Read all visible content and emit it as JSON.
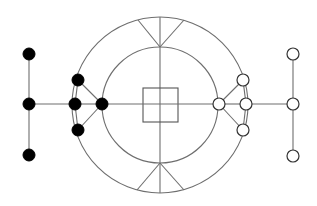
{
  "diagram": {
    "width": 317,
    "height": 206,
    "colors": {
      "line": "#6e6e6e",
      "filled_node": "#000000",
      "open_node_fill": "#ffffff",
      "open_node_stroke": "#333333",
      "background": "#ffffff"
    },
    "center": {
      "x": 160,
      "y": 105
    },
    "rings": [
      {
        "name": "outer-ring",
        "r": 88
      },
      {
        "name": "inner-ring",
        "r": 58
      }
    ],
    "center_square": {
      "x": 143,
      "y": 88,
      "w": 35,
      "h": 34
    },
    "spokes": [
      {
        "name": "vertical-axis",
        "x1": 160,
        "y1": 17,
        "x2": 160,
        "y2": 193
      },
      {
        "name": "top-spoke-left",
        "x1": 160,
        "y1": 47,
        "x2": 138,
        "y2": 20
      },
      {
        "name": "top-spoke-right",
        "x1": 160,
        "y1": 47,
        "x2": 184,
        "y2": 20
      },
      {
        "name": "bottom-spoke-left",
        "x1": 160,
        "y1": 163,
        "x2": 137,
        "y2": 190
      },
      {
        "name": "bottom-spoke-right",
        "x1": 160,
        "y1": 163,
        "x2": 184,
        "y2": 190
      }
    ],
    "nodes": [
      {
        "id": "L1",
        "x": 29,
        "y": 54,
        "type": "filled"
      },
      {
        "id": "L2",
        "x": 29,
        "y": 104,
        "type": "filled"
      },
      {
        "id": "L3",
        "x": 29,
        "y": 155,
        "type": "filled"
      },
      {
        "id": "B1",
        "x": 78,
        "y": 80,
        "type": "filled"
      },
      {
        "id": "B2",
        "x": 75,
        "y": 104,
        "type": "filled"
      },
      {
        "id": "B3",
        "x": 78,
        "y": 130,
        "type": "filled"
      },
      {
        "id": "B4",
        "x": 102,
        "y": 104,
        "type": "filled"
      },
      {
        "id": "W4",
        "x": 219,
        "y": 104,
        "type": "open"
      },
      {
        "id": "W1",
        "x": 243,
        "y": 80,
        "type": "open"
      },
      {
        "id": "W2",
        "x": 246,
        "y": 104,
        "type": "open"
      },
      {
        "id": "W3",
        "x": 243,
        "y": 130,
        "type": "open"
      },
      {
        "id": "R1",
        "x": 293,
        "y": 54,
        "type": "open"
      },
      {
        "id": "R2",
        "x": 293,
        "y": 104,
        "type": "open"
      },
      {
        "id": "R3",
        "x": 293,
        "y": 156,
        "type": "open"
      }
    ],
    "edges": [
      [
        "L1",
        "L2"
      ],
      [
        "L2",
        "L3"
      ],
      [
        "L2",
        "B2"
      ],
      [
        "B1",
        "B2"
      ],
      [
        "B2",
        "B3"
      ],
      [
        "B1",
        "B4"
      ],
      [
        "B2",
        "B4"
      ],
      [
        "B3",
        "B4"
      ],
      [
        "B4",
        "W4"
      ],
      [
        "W4",
        "W1"
      ],
      [
        "W4",
        "W2"
      ],
      [
        "W4",
        "W3"
      ],
      [
        "W1",
        "W2"
      ],
      [
        "W2",
        "W3"
      ],
      [
        "W2",
        "R2"
      ],
      [
        "R1",
        "R2"
      ],
      [
        "R2",
        "R3"
      ]
    ],
    "node_radius": 6
  }
}
